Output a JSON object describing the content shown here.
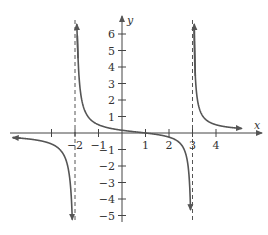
{
  "chart_data": {
    "type": "line",
    "title": "",
    "function": "f(x) = (x - 1) / ((x + 2)(x - 3))",
    "xlabel": "x",
    "ylabel": "y",
    "xlim": [
      -5,
      5
    ],
    "ylim": [
      -5,
      7
    ],
    "x_ticks": [
      -3,
      -2,
      -1,
      1,
      2,
      3,
      4
    ],
    "x_tick_labels": [
      "",
      "-2",
      "-1",
      "1",
      "2",
      "3",
      "4"
    ],
    "y_ticks": [
      -5,
      -4,
      -3,
      -2,
      -1,
      1,
      2,
      3,
      4,
      5,
      6
    ],
    "y_tick_labels": [
      "-5",
      "-4",
      "-3",
      "-2",
      "-1",
      "1",
      "2",
      "3",
      "4",
      "5",
      "6"
    ],
    "vertical_asymptotes": [
      -2,
      3
    ],
    "horizontal_asymptote": 0,
    "x_intercept": 1,
    "y_intercept": 0.1667,
    "branches": [
      {
        "name": "left",
        "domain": [
          -5,
          -2
        ],
        "behavior": "approaches 0 from below as x→-∞, →-∞ as x→-2⁻"
      },
      {
        "name": "middle",
        "domain": [
          -2,
          3
        ],
        "behavior": "+∞ as x→-2⁺, crosses x-axis at 1, -∞ as x→3⁻"
      },
      {
        "name": "right",
        "domain": [
          3,
          5
        ],
        "behavior": "+∞ as x→3⁺, approaches 0 from above"
      }
    ],
    "grid": false,
    "colors": {
      "curve": "#555555",
      "axis": "#444444",
      "asymptote": "#555555"
    }
  },
  "axes": {
    "x_label": "x",
    "y_label": "y"
  }
}
